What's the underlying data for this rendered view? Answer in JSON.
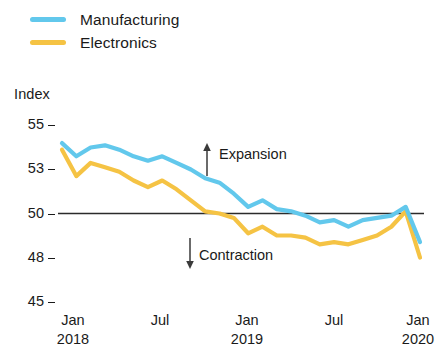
{
  "legend": {
    "position": "top-left",
    "items": [
      {
        "label": "Manufacturing",
        "color": "#62c8ec"
      },
      {
        "label": "Electronics",
        "color": "#f5c344"
      }
    ]
  },
  "axes": {
    "y_title": "Index",
    "y_ticks": [
      "55",
      "53",
      "50",
      "48",
      "45"
    ],
    "x_ticks": [
      {
        "month": "Jan",
        "year": "2018"
      },
      {
        "month": "Jul",
        "year": ""
      },
      {
        "month": "Jan",
        "year": "2019"
      },
      {
        "month": "Jul",
        "year": ""
      },
      {
        "month": "Jan",
        "year": "2020"
      }
    ]
  },
  "annotations": {
    "expansion": {
      "arrow": "↑",
      "label": "Expansion"
    },
    "contraction": {
      "arrow": "↓",
      "label": "Contraction"
    }
  },
  "chart_data": {
    "type": "line",
    "title": "",
    "subtitle": "",
    "xlabel": "",
    "ylabel": "Index",
    "ylim": [
      45,
      55.8
    ],
    "yticks": [
      45,
      48,
      50,
      53,
      55
    ],
    "grid": false,
    "legend_position": "top-left",
    "reference_line": {
      "value": 50,
      "color": "#2b2b2b",
      "label": ""
    },
    "x": [
      "2018-01",
      "2018-02",
      "2018-03",
      "2018-04",
      "2018-05",
      "2018-06",
      "2018-07",
      "2018-08",
      "2018-09",
      "2018-10",
      "2018-11",
      "2018-12",
      "2019-01",
      "2019-02",
      "2019-03",
      "2019-04",
      "2019-05",
      "2019-06",
      "2019-07",
      "2019-08",
      "2019-09",
      "2019-10",
      "2019-11",
      "2019-12",
      "2020-01",
      "2020-02"
    ],
    "x_tick_labels": [
      "Jan 2018",
      "Jul",
      "Jan 2019",
      "Jul",
      "Jan 2020"
    ],
    "series": [
      {
        "name": "Manufacturing",
        "color": "#62c8ec",
        "values": [
          53.2,
          52.6,
          53.0,
          53.1,
          52.9,
          52.6,
          52.4,
          52.6,
          52.3,
          52.0,
          51.6,
          51.4,
          50.9,
          50.3,
          50.6,
          50.2,
          50.1,
          49.9,
          49.6,
          49.7,
          49.4,
          49.7,
          49.8,
          49.9,
          50.3,
          48.7
        ]
      },
      {
        "name": "Electronics",
        "color": "#f5c344",
        "values": [
          52.9,
          51.7,
          52.3,
          52.1,
          51.9,
          51.5,
          51.2,
          51.5,
          51.1,
          50.6,
          50.1,
          50.0,
          49.8,
          49.1,
          49.4,
          49.0,
          49.0,
          48.9,
          48.6,
          48.7,
          48.6,
          48.8,
          49.0,
          49.4,
          50.1,
          48.0
        ]
      }
    ]
  }
}
